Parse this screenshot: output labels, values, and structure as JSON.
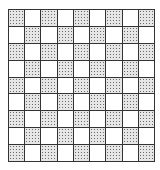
{
  "board": {
    "rows": 9,
    "cols": 9,
    "pattern": "checkerboard",
    "start_cell": "stippled",
    "colors": {
      "light": "#ffffff",
      "stippled": "#e6e6e6",
      "dots": "#6a6a6a",
      "lines": "#333333"
    }
  }
}
